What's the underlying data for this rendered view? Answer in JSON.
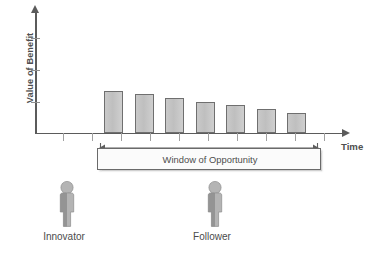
{
  "chart_data": {
    "type": "bar",
    "title": "",
    "subtitle": "",
    "xlabel": "Time",
    "ylabel": "Value of Benefit",
    "grid": false,
    "legend": false,
    "categories": [
      "1",
      "2",
      "3",
      "4",
      "5",
      "6",
      "7"
    ],
    "values": [
      42,
      39,
      35,
      31,
      28,
      24,
      20
    ],
    "ylim": [
      0,
      100
    ],
    "xlim": [
      0,
      11
    ],
    "y_tick_count": 3,
    "x_tick_count": 11,
    "annotations": [
      {
        "name": "window-of-opportunity",
        "text": "Window of Opportunity",
        "from_category": 1,
        "to_category": 7
      },
      {
        "name": "innovator",
        "text": "Innovator"
      },
      {
        "name": "follower",
        "text": "Follower"
      }
    ],
    "bar_geometry": [
      {
        "x": 104.0,
        "width": 19.0,
        "height": 42.0
      },
      {
        "x": 134.5,
        "width": 19.0,
        "height": 39.0
      },
      {
        "x": 165.0,
        "width": 19.0,
        "height": 35.0
      },
      {
        "x": 195.5,
        "width": 19.0,
        "height": 31.0
      },
      {
        "x": 226.0,
        "width": 19.0,
        "height": 28.0
      },
      {
        "x": 256.5,
        "width": 19.0,
        "height": 24.0
      },
      {
        "x": 287.0,
        "width": 19.0,
        "height": 20.0
      }
    ],
    "y_tick_positions": [
      38,
      70,
      102
    ],
    "x_tick_positions": [
      63,
      92,
      121,
      150,
      179,
      208,
      237,
      266,
      295,
      324
    ],
    "baseline_y": 133
  },
  "axes": {
    "y_title": "Value of Benefit",
    "x_title": "Time"
  },
  "window": {
    "label": "Window of Opportunity"
  },
  "actors": {
    "innovator": {
      "label": "Innovator"
    },
    "follower": {
      "label": "Follower"
    }
  },
  "colors": {
    "bar_fill": "#c6c6c6",
    "bar_stroke": "#6f6f6f",
    "axis": "#5b5b5b",
    "text": "#4b4b4b",
    "person_fill": "#b0b0b0",
    "person_shadow": "#6e6e6e",
    "window_border": "#6a6a6a",
    "window_fill": "#fbfbfb"
  }
}
